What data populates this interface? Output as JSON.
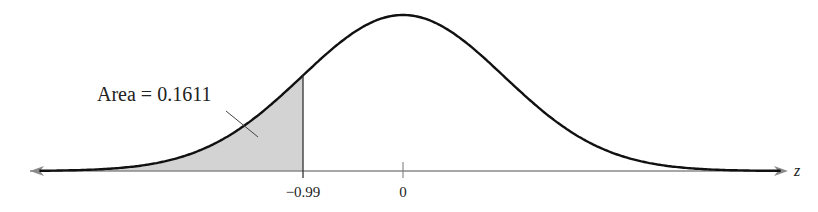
{
  "chart_data": {
    "type": "area",
    "title": "",
    "xlabel": "z",
    "ylabel": "",
    "tick_labels": [
      "-0.99",
      "0"
    ],
    "tick_values": [
      -0.99,
      0
    ],
    "shaded_region": {
      "from": "-inf",
      "to": -0.99,
      "area": 0.1611
    },
    "annotation": "Area = 0.1611",
    "xlim": [
      -3.7,
      3.8
    ],
    "grid": false,
    "legend": "none",
    "colors": {
      "curve": "#111111",
      "shade": "#d2d2d2",
      "axis": "#888888"
    }
  },
  "labels": {
    "annotation": "Area = 0.1611",
    "tick_neg": "−0.99",
    "tick_zero": "0",
    "axis_var": "z"
  }
}
